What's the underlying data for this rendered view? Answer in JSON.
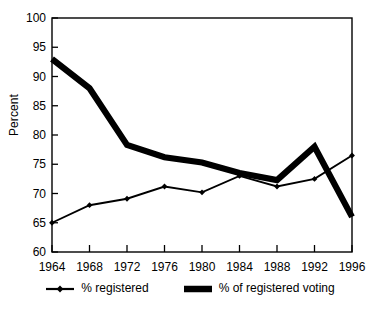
{
  "chart_data": {
    "type": "line",
    "title": "",
    "subtitle": "",
    "xlabel": "",
    "ylabel": "Percent",
    "categories": [
      "1964",
      "1968",
      "1972",
      "1976",
      "1980",
      "1984",
      "1988",
      "1992",
      "1996"
    ],
    "x": [
      1964,
      1968,
      1972,
      1976,
      1980,
      1984,
      1988,
      1992,
      1996
    ],
    "xlim": [
      1964,
      1996
    ],
    "ylim": [
      60,
      100
    ],
    "yticks": [
      60,
      65,
      70,
      75,
      80,
      85,
      90,
      95,
      100
    ],
    "ytick_labels": [
      "60",
      "65",
      "70",
      "75",
      "80",
      "85",
      "90",
      "95",
      "100"
    ],
    "xticks": [
      1964,
      1968,
      1972,
      1976,
      1980,
      1984,
      1988,
      1992,
      1996
    ],
    "xtick_labels": [
      "1964",
      "1968",
      "1972",
      "1976",
      "1980",
      "1984",
      "1988",
      "1992",
      "1996"
    ],
    "grid": false,
    "legend_position": "bottom",
    "series": [
      {
        "name": "% registered",
        "style": "thin-line-with-markers",
        "marker": "diamond",
        "color": "#000000",
        "values": [
          65.0,
          68.0,
          69.1,
          71.2,
          70.2,
          73.0,
          71.2,
          72.5,
          76.5
        ]
      },
      {
        "name": "% of registered voting",
        "style": "thick-line",
        "marker": "none",
        "color": "#000000",
        "values": [
          93.0,
          88.0,
          78.3,
          76.2,
          75.3,
          73.5,
          72.3,
          78.0,
          66.0
        ]
      }
    ]
  },
  "axis": {
    "ylabel": "Percent"
  },
  "legend": {
    "items": [
      {
        "label": "% registered"
      },
      {
        "label": "% of registered voting"
      }
    ]
  }
}
